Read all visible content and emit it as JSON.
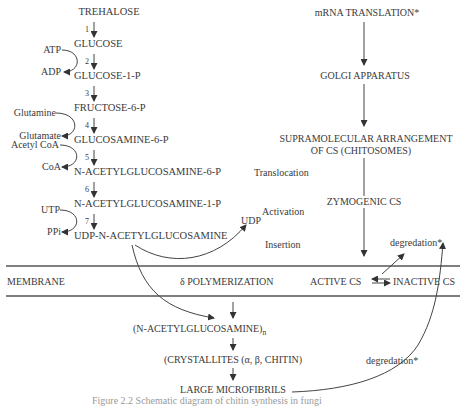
{
  "pathway": {
    "compounds": [
      {
        "label": "TREHALOSE"
      },
      {
        "label": "GLUCOSE"
      },
      {
        "label": "GLUCOSE-1-P"
      },
      {
        "label": "FRUCTOSE-6-P"
      },
      {
        "label": "GLUCOSAMINE-6-P"
      },
      {
        "label": "N-ACETYLGLUCOSAMINE-6-P"
      },
      {
        "label": "N-ACETYLGLUCOSAMINE-1-P"
      },
      {
        "label": "UDP-N-ACETYLGLUCOSAMINE"
      }
    ],
    "steps": [
      "1",
      "2",
      "3",
      "4",
      "5",
      "6",
      "7"
    ],
    "cofactors": {
      "atp": "ATP",
      "adp": "ADP",
      "glutamine": "Glutamine",
      "glutamate": "Glutamate",
      "acetyl_coa": "Acetyl CoA",
      "coa": "CoA",
      "utp": "UTP",
      "ppi": "PPi"
    },
    "udp": "UDP"
  },
  "enzyme_route": {
    "mrna": "mRNA  TRANSLATION*",
    "golgi": "GOLGI APPARATUS",
    "supra_line1": "SUPRAMOLECULAR ARRANGEMENT",
    "supra_line2": "OF  CS  (CHITOSOMES)",
    "zymogenic": "ZYMOGENIC  CS",
    "translocation": "Translocation",
    "activation": "Activation",
    "insertion": "Insertion",
    "degradation_top": "degredation*"
  },
  "membrane": {
    "label": "MEMBRANE",
    "polymerization": "δ POLYMERIZATION",
    "active": "ACTIVE CS",
    "inactive": "INACTIVE CS"
  },
  "products": {
    "polymer": "(N-ACETYLGLUCOSAMINE)",
    "polymer_sub": "n",
    "crystallites": "(CRYSTALLITES (α, β, CHITIN)",
    "microfibrils": "LARGE MICROFIBRILS",
    "degradation_bottom": "degredation*"
  },
  "caption": "Figure 2.2  Schematic diagram of chitin synthesis in fungi"
}
